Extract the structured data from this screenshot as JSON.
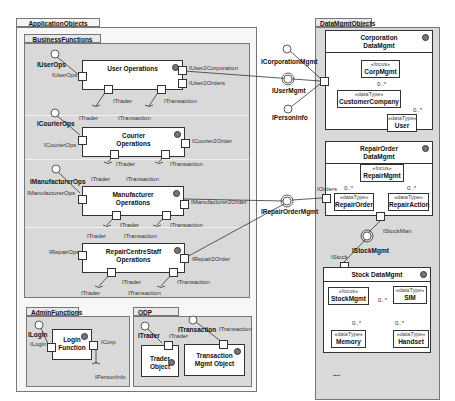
{
  "diagram": {
    "type": "UML component diagram",
    "packages": {
      "application_objects": "ApplicationObjects",
      "business_functions": "BusinessFunctions",
      "admin_functions": "AdminFunctions",
      "odp_functions": "ODP Functions",
      "data_mgmt_objects": "DataMgmtObjects"
    },
    "components": {
      "user_ops": {
        "name": "User Operations",
        "provided": "IUserOps",
        "port_in": "IUserOps",
        "port_out1": "IUser2Corporation",
        "port_out2": "IUser2Orders",
        "req1": "ITrader",
        "req2": "ITransaction",
        "req1_lbl": "ITrader",
        "req2_lbl": "ITransaction"
      },
      "courier_ops": {
        "name_l1": "Courier",
        "name_l2": "Operations",
        "provided": "ICourierOps",
        "port_in": "ICourierOps",
        "port_out": "ICourier2Order",
        "req1": "ITrader",
        "req2": "ITransaction",
        "req1_lbl": "ITrader",
        "req2_lbl": "ITransaction"
      },
      "manufacturer_ops": {
        "name_l1": "Manufacturer",
        "name_l2": "Operations",
        "provided": "IManufacturerOps",
        "port_in": "IManufacturerOps",
        "port_out": "IManufacturer2Order",
        "req1": "ITrader",
        "req2": "ITransaction",
        "req1_lbl": "ITrader",
        "req2_lbl": "ITransaction"
      },
      "repair_ops": {
        "name_l1": "RepairCentreStaff",
        "name_l2": "Operations",
        "port_in": "IRepairOps",
        "port_out": "IRepair2Order",
        "req1": "ITrader",
        "req2": "ITransaction",
        "req1_lbl": "ITrader",
        "req2_lbl": "ITransaction"
      },
      "login": {
        "name_l1": "Login",
        "name_l2": "Function",
        "provided": "ILogin",
        "port_in": "ILogin",
        "port_out": "ICorp",
        "req": "IPersonInfo"
      },
      "trader": {
        "name_l1": "Trader",
        "name_l2": "Object",
        "provided": "ITrader",
        "port": "ITrader"
      },
      "transaction": {
        "name_l1": "Transaction",
        "name_l2": "Mgmt Object",
        "provided": "ITransaction",
        "port": "ITransaction"
      },
      "corp_data": {
        "name_l1": "Corporation",
        "name_l2": "DataMgmt"
      },
      "repair_data": {
        "name_l1": "RepairOrder",
        "name_l2": "DataMgmt",
        "port_in": "IOrders",
        "port_out": "IStockMan"
      },
      "stock_data": {
        "name": "Stock DataMgmt",
        "port_in": "IStock"
      }
    },
    "interfaces": {
      "corp_mgmt": "ICorporationMgmt",
      "user_mgmt": "IUserMgmt",
      "person_info": "IPersonInfo",
      "repair_order_mgmt": "IRepairOrderMgmt",
      "stock_mgmt": "IStockMgmt"
    },
    "classes": {
      "corp_mgmt": {
        "stereo": "«focus»",
        "name": "CorpMgmt"
      },
      "customer_company": {
        "stereo": "«dataType»",
        "name": "CustomerCompany"
      },
      "user": {
        "stereo": "«dataType»",
        "name": "User"
      },
      "repair_mgmt": {
        "stereo": "«focus»",
        "name": "RepairMgmt"
      },
      "repair_order": {
        "stereo": "«dataType»",
        "name": "RepairOrder"
      },
      "repair_action": {
        "stereo": "«dataType»",
        "name": "RepairAction"
      },
      "stock_mgmt": {
        "stereo": "«focus»",
        "name": "StockMgmt"
      },
      "sim": {
        "stereo": "«dataType»",
        "name": "SIM"
      },
      "memory": {
        "stereo": "«dataType»",
        "name": "Memory"
      },
      "handset": {
        "stereo": "«dataType»",
        "name": "Handset"
      }
    },
    "multiplicities": {
      "m1": "0..*",
      "m2": "0..*",
      "m3": "0..*",
      "m4": "0..*",
      "m5": "0..*",
      "m6": "0..*",
      "m7": "0..*"
    },
    "ellipsis": "...."
  }
}
